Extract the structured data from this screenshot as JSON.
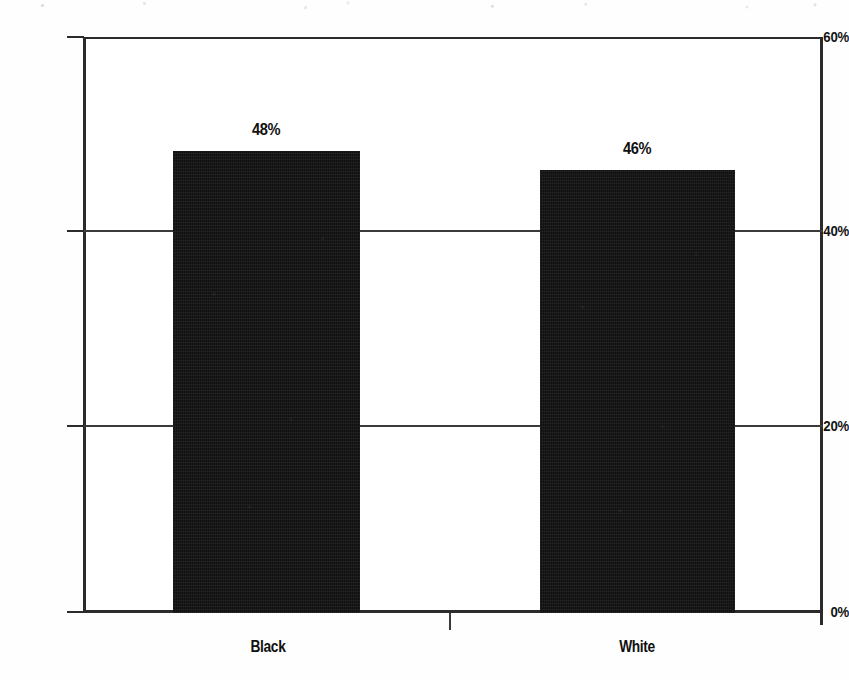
{
  "chart_data": {
    "type": "bar",
    "title": "",
    "subtitle": "",
    "xlabel": "",
    "ylabel": "",
    "categories": [
      "Black",
      "White"
    ],
    "values": [
      48,
      46
    ],
    "value_labels": [
      "48%",
      "46%"
    ],
    "ylim": [
      0,
      60
    ],
    "ytick_values": [
      0,
      20,
      40,
      60
    ],
    "ytick_labels": [
      "0%",
      "20%",
      "40%",
      "60%"
    ],
    "grid": "horizontal",
    "gridlines_at": [
      20,
      40
    ],
    "legend": "none",
    "bar_color": "#111111",
    "axis_color": "#2b2b2b",
    "text_color": "#101010",
    "background_color": "#ffffff",
    "series": [
      {
        "name": "",
        "values": [
          48,
          46
        ]
      }
    ]
  },
  "axis": {
    "y": {
      "tick_60": "60%",
      "tick_40": "40%",
      "tick_20": "20%",
      "tick_0": "0%"
    },
    "x": {
      "cat_1": "Black",
      "cat_2": "White"
    }
  },
  "bars": [
    {
      "category": "Black",
      "label": "48%",
      "value": 48
    },
    {
      "category": "White",
      "label": "46%",
      "value": 46
    }
  ]
}
